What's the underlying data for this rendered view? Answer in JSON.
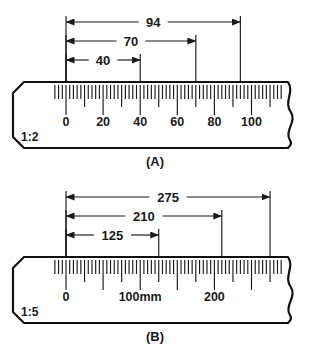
{
  "figure": {
    "background_color": "#ffffff",
    "line_color": "#1a1a1a"
  },
  "rulers": [
    {
      "id": "ruler-a",
      "caption": "(A)",
      "scale_ratio": "1:2",
      "unit_suffix": "",
      "scale_labels": [
        "0",
        "20",
        "40",
        "60",
        "80",
        "100"
      ],
      "scale_label_values": [
        0,
        20,
        40,
        60,
        80,
        100
      ],
      "tick_minor_step": 2,
      "tick_medium_step": 10,
      "tick_major_step": 20,
      "scale_range": [
        -6,
        116
      ],
      "dimensions": [
        {
          "label": "94",
          "value": 94,
          "from": 0,
          "to": 94,
          "row": 0
        },
        {
          "label": "70",
          "value": 70,
          "from": 0,
          "to": 70,
          "row": 1
        },
        {
          "label": "40",
          "value": 40,
          "from": 0,
          "to": 40,
          "row": 2
        }
      ]
    },
    {
      "id": "ruler-b",
      "caption": "(B)",
      "scale_ratio": "1:5",
      "unit_suffix": "mm",
      "scale_labels": [
        "0",
        "100mm",
        "200"
      ],
      "scale_label_values": [
        0,
        100,
        200
      ],
      "tick_minor_step": 5,
      "tick_medium_step": 25,
      "tick_major_step": 50,
      "scale_range": [
        -15,
        290
      ],
      "dimensions": [
        {
          "label": "275",
          "value": 275,
          "from": 0,
          "to": 275,
          "row": 0
        },
        {
          "label": "210",
          "value": 210,
          "from": 0,
          "to": 210,
          "row": 1
        },
        {
          "label": "125",
          "value": 125,
          "from": 0,
          "to": 125,
          "row": 2
        }
      ]
    }
  ]
}
